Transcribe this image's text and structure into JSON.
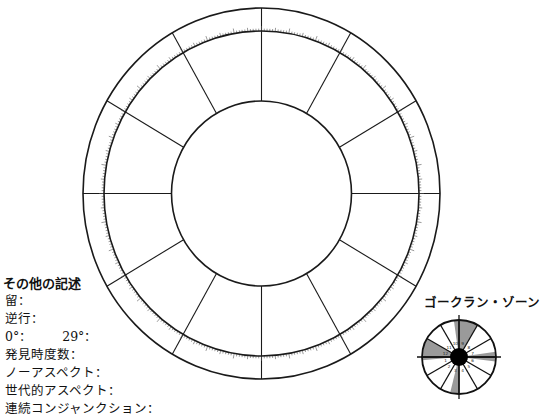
{
  "main_wheel": {
    "center": [
      261.5,
      193.5
    ],
    "outer_radius": [
      178.5,
      185.5
    ],
    "tick_ring_radius": [
      157.5,
      162.5
    ],
    "inner_radius": [
      90,
      92.5
    ],
    "spoke_angles_deg": [
      0,
      30,
      60,
      90,
      120,
      150,
      180,
      210,
      240,
      270,
      300,
      330
    ],
    "tick_count": 360,
    "stroke_color": "#1a1a1a",
    "tick_color": "#555555"
  },
  "notes": {
    "title": "その他の記述",
    "items": [
      {
        "label": "留："
      },
      {
        "label": "逆行："
      },
      {
        "label": "0°：",
        "label2": "29°："
      },
      {
        "label": "発見時度数："
      },
      {
        "label": "ノーアスペクト："
      },
      {
        "label": "世代的アスペクト："
      },
      {
        "label": "連続コンジャンクション："
      }
    ]
  },
  "gauquelin": {
    "title": "ゴークラン・ゾーン",
    "center": [
      459,
      357
    ],
    "radius": 37,
    "hub_radius": 9,
    "spoke_angles_deg": [
      0,
      30,
      60,
      90,
      120,
      150,
      180,
      210,
      240,
      270,
      300,
      330
    ],
    "shaded_sectors": [
      {
        "from": -8,
        "to": 30
      },
      {
        "from": 265,
        "to": 300
      },
      {
        "from": 82,
        "to": 97
      },
      {
        "from": 180,
        "to": 194
      }
    ],
    "shade_color": "#9a9a9a",
    "sector_labels": [
      "1",
      "2",
      "3",
      "4",
      "5",
      "6",
      "7",
      "8",
      "9",
      "10",
      "11",
      "12"
    ]
  }
}
